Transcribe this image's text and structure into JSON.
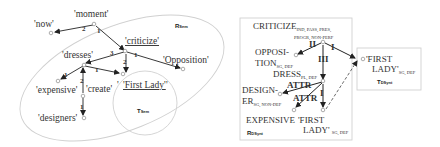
{
  "semantic": {
    "region_label": "R",
    "region_sub": "Sem",
    "target_label": "T",
    "target_sub": "Sem",
    "nodes": {
      "moment": "'moment'",
      "now": "'now'",
      "criticize": "'criticize'",
      "dresses": "'dresses'",
      "opposition": "'Opposition'",
      "expensive": "'expensive'",
      "create": "'create'",
      "first_lady": "'First Lady'",
      "first_lady_open": "'",
      "first_lady_close": "'",
      "designers": "'designers'"
    },
    "edges": {
      "moment_now": "2",
      "moment_criticize": "1",
      "criticize_dresses": "3",
      "criticize_opposition": "1",
      "criticize_firstlady": "2",
      "dresses_expensive": "1",
      "dresses_firstlady": "1",
      "create_dresses": "2",
      "create_designers": "1"
    }
  },
  "dsynt": {
    "region_label": "R",
    "region_sub": "DSynt",
    "target_label": "T",
    "target_sub": "DSynt",
    "nodes": {
      "criticize": "CRITICIZE",
      "criticize_sub1": "IND, PASS, PRES,",
      "criticize_sub2": "PROGR, NON-PERF",
      "opposition1": "OPPOSI-",
      "opposition2": "TION",
      "opposition_sub": "SG, DEF",
      "dress": "DRESS",
      "dress_sub": "PL, DEF",
      "designer1": "DESIGN-",
      "designer2": "ER",
      "designer_sub": "SG, NON-DEF",
      "expensive": "EXPENSIVE",
      "first_lady1": "'FIRST",
      "first_lady2": "LADY'",
      "first_lady_sub": "SG, DEF",
      "t_first_lady1": "'FIRST",
      "t_first_lady2": "LADY'",
      "t_first_lady_sub": "SG, DEF"
    },
    "edges": {
      "criticize_opposition": "II",
      "criticize_firstlady": "I",
      "criticize_dress": "III",
      "dress_designer": "ATTR",
      "dress_expensive": "ATTR",
      "dress_firstlady": "I"
    }
  }
}
